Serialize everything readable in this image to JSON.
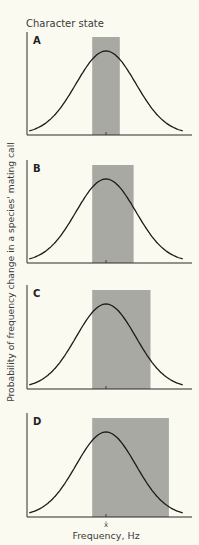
{
  "chart_data": {
    "type": "line",
    "title": "Character state",
    "xlabel": "Frequency, Hz",
    "ylabel": "Probability of frequency change in a species' mating call",
    "x_tick_label": "x̄",
    "x_tick_meaning": "mean frequency",
    "colors": {
      "curve": "#1a1a1a",
      "band": "#a9a9a4",
      "axis": "#2a2a2a",
      "background": "#fbfaf1"
    },
    "panels": [
      {
        "label": "A",
        "curve": "normal",
        "mean": 0,
        "band_from_sd": -0.45,
        "band_to_sd": 0.45
      },
      {
        "label": "B",
        "curve": "normal",
        "mean": 0,
        "band_from_sd": -0.45,
        "band_to_sd": 0.9
      },
      {
        "label": "C",
        "curve": "normal",
        "mean": 0,
        "band_from_sd": -0.45,
        "band_to_sd": 1.45
      },
      {
        "label": "D",
        "curve": "normal",
        "mean": 0,
        "band_from_sd": -0.45,
        "band_to_sd": 2.05
      }
    ],
    "x_range_sd": [
      -2.5,
      2.5
    ],
    "grid": false,
    "legend": "none"
  }
}
